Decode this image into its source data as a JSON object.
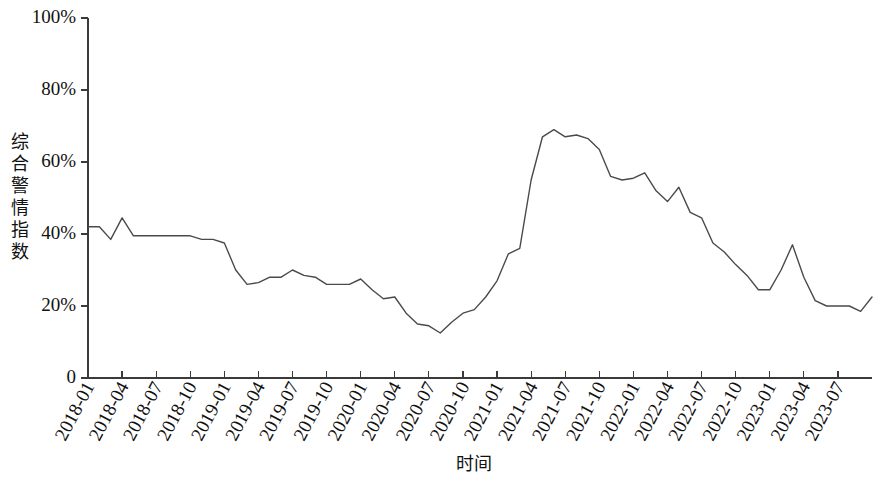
{
  "chart_data": {
    "type": "line",
    "title": "",
    "subtitle": "",
    "xlabel": "时间",
    "ylabel": "综合警情指数",
    "grid": false,
    "legend": false,
    "legend_position": "none",
    "ylim": [
      0,
      100
    ],
    "ytick_labels": [
      "0",
      "20%",
      "40%",
      "60%",
      "80%",
      "100%"
    ],
    "ytick_values": [
      0,
      20,
      40,
      60,
      80,
      100
    ],
    "xtick_labels": [
      "2018-01",
      "2018-04",
      "2018-07",
      "2018-10",
      "2019-01",
      "2019-04",
      "2019-07",
      "2019-10",
      "2020-01",
      "2020-04",
      "2020-07",
      "2020-10",
      "2021-01",
      "2021-04",
      "2021-07",
      "2021-10",
      "2022-01",
      "2022-04",
      "2022-07",
      "2022-10",
      "2023-01",
      "2023-04",
      "2023-07"
    ],
    "xtick_rotation_deg": 62,
    "x_unit": "month",
    "x_start": "2018-01",
    "x_end": "2023-10",
    "series": [
      {
        "name": "综合警情指数",
        "color": "#4a4a4a",
        "x": [
          "2018-01",
          "2018-02",
          "2018-03",
          "2018-04",
          "2018-05",
          "2018-06",
          "2018-07",
          "2018-08",
          "2018-09",
          "2018-10",
          "2018-11",
          "2018-12",
          "2019-01",
          "2019-02",
          "2019-03",
          "2019-04",
          "2019-05",
          "2019-06",
          "2019-07",
          "2019-08",
          "2019-09",
          "2019-10",
          "2019-11",
          "2019-12",
          "2020-01",
          "2020-02",
          "2020-03",
          "2020-04",
          "2020-05",
          "2020-06",
          "2020-07",
          "2020-08",
          "2020-09",
          "2020-10",
          "2020-11",
          "2020-12",
          "2021-01",
          "2021-02",
          "2021-03",
          "2021-04",
          "2021-05",
          "2021-06",
          "2021-07",
          "2021-08",
          "2021-09",
          "2021-10",
          "2021-11",
          "2021-12",
          "2022-01",
          "2022-02",
          "2022-03",
          "2022-04",
          "2022-05",
          "2022-06",
          "2022-07",
          "2022-08",
          "2022-09",
          "2022-10",
          "2022-11",
          "2022-12",
          "2023-01",
          "2023-02",
          "2023-03",
          "2023-04",
          "2023-05",
          "2023-06",
          "2023-07",
          "2023-08",
          "2023-09",
          "2023-10"
        ],
        "values": [
          42.0,
          42.0,
          38.5,
          44.5,
          39.5,
          39.5,
          39.5,
          39.5,
          39.5,
          39.5,
          38.5,
          38.5,
          37.5,
          30.0,
          26.0,
          26.5,
          28.0,
          28.0,
          30.0,
          28.5,
          28.0,
          26.0,
          26.0,
          26.0,
          27.5,
          24.5,
          22.0,
          22.5,
          18.0,
          15.0,
          14.5,
          12.5,
          15.5,
          18.0,
          19.0,
          22.5,
          27.0,
          34.5,
          36.0,
          55.0,
          67.0,
          69.0,
          67.0,
          67.5,
          66.5,
          63.5,
          56.0,
          55.0,
          55.5,
          57.0,
          52.0,
          49.0,
          53.0,
          46.0,
          44.5,
          37.5,
          35.0,
          31.5,
          28.5,
          24.5,
          24.5,
          30.0,
          37.0,
          28.0,
          21.5,
          20.0,
          20.0,
          20.0,
          18.5,
          22.5
        ]
      }
    ]
  }
}
